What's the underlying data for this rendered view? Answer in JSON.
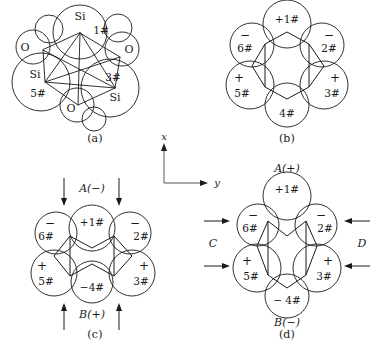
{
  "figure": {
    "stroke_color": "#1a1a1a",
    "background_color": "#ffffff"
  },
  "axis_indicator": {
    "name": "coordinate-axes",
    "vertical_label": "x",
    "horizontal_label": "y"
  },
  "panels": [
    {
      "id": "a",
      "caption": "(a)",
      "type": "packed-sphere-model",
      "atoms": [
        {
          "element": "Si",
          "index": "1#",
          "position": "top"
        },
        {
          "element": "Si",
          "index": "3#",
          "position": "lower-right"
        },
        {
          "element": "Si",
          "index": "5#",
          "position": "left"
        },
        {
          "element": "O",
          "index": "",
          "position": "upper-left"
        },
        {
          "element": "O",
          "index": "",
          "position": "right"
        },
        {
          "element": "O",
          "index": "",
          "position": "bottom"
        }
      ],
      "labels": {
        "si_top": "Si",
        "si_left": "Si",
        "si_lower_right": "Si",
        "o_upper_left": "O",
        "o_right": "O",
        "o_bottom": "O",
        "idx_1": "1#",
        "idx_3": "3#",
        "idx_5": "5#"
      }
    },
    {
      "id": "b",
      "caption": "(b)",
      "type": "hexagonal-ring-relaxed",
      "sites": [
        {
          "index": "1#",
          "sign": "+",
          "sign_inline": true,
          "position": "top"
        },
        {
          "index": "2#",
          "sign": "−",
          "sign_inline": false,
          "position": "upper-right"
        },
        {
          "index": "3#",
          "sign": "+",
          "sign_inline": false,
          "position": "lower-right"
        },
        {
          "index": "4#",
          "sign": "",
          "sign_inline": false,
          "position": "bottom"
        },
        {
          "index": "5#",
          "sign": "+",
          "sign_inline": false,
          "position": "lower-left"
        },
        {
          "index": "6#",
          "sign": "−",
          "sign_inline": false,
          "position": "upper-left"
        }
      ]
    },
    {
      "id": "c",
      "caption": "(c)",
      "type": "hexagonal-ring-vertical-compression",
      "load_top": "A(−)",
      "load_bottom": "B(+)",
      "arrow_top_direction": "down",
      "arrow_bottom_direction": "up",
      "sites": [
        {
          "index": "1#",
          "sign": "+",
          "sign_inline": true,
          "position": "top"
        },
        {
          "index": "2#",
          "sign": "−",
          "sign_inline": false,
          "position": "upper-right"
        },
        {
          "index": "3#",
          "sign": "+",
          "sign_inline": false,
          "position": "lower-right"
        },
        {
          "index": "4#",
          "sign": "−",
          "sign_inline": true,
          "position": "bottom"
        },
        {
          "index": "5#",
          "sign": "+",
          "sign_inline": false,
          "position": "lower-left"
        },
        {
          "index": "6#",
          "sign": "−",
          "sign_inline": false,
          "position": "upper-left"
        }
      ]
    },
    {
      "id": "d",
      "caption": "(d)",
      "type": "hexagonal-ring-horizontal-compression",
      "load_top": "A(+)",
      "load_bottom": "B(−)",
      "load_left": "C",
      "load_right": "D",
      "arrow_left_direction": "right",
      "arrow_right_direction": "left",
      "sites": [
        {
          "index": "1#",
          "sign": "+",
          "sign_inline": true,
          "position": "top"
        },
        {
          "index": "2#",
          "sign": "−",
          "sign_inline": false,
          "position": "upper-right"
        },
        {
          "index": "3#",
          "sign": "+",
          "sign_inline": false,
          "position": "lower-right"
        },
        {
          "index": "4#",
          "sign": "−",
          "sign_inline": true,
          "position": "bottom"
        },
        {
          "index": "5#",
          "sign": "+",
          "sign_inline": false,
          "position": "lower-left"
        },
        {
          "index": "6#",
          "sign": "−",
          "sign_inline": false,
          "position": "upper-left"
        }
      ]
    }
  ]
}
